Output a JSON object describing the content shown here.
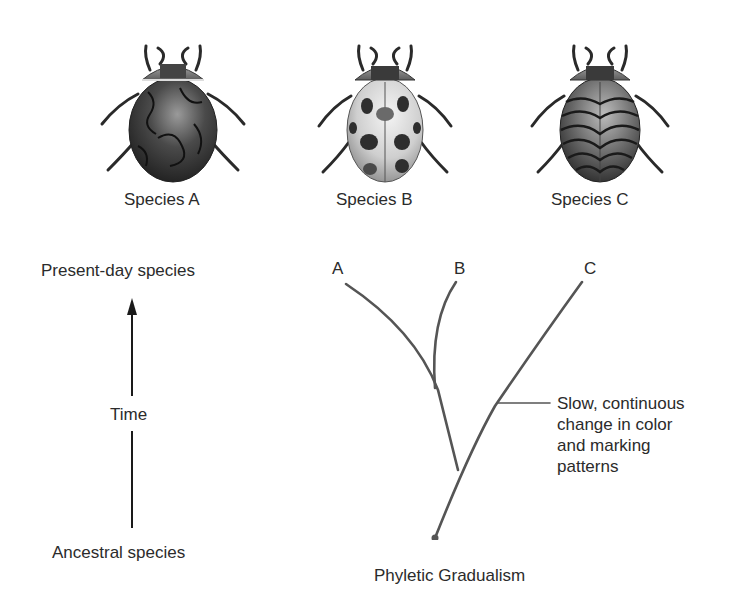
{
  "species": [
    {
      "id": "A",
      "label": "Species A",
      "pattern": "marbled-dark-lines",
      "shell_color": "#3a3a3a"
    },
    {
      "id": "B",
      "label": "Species B",
      "pattern": "spotted",
      "shell_color": "#d6d6d6"
    },
    {
      "id": "C",
      "label": "Species C",
      "pattern": "wavy-stripes",
      "shell_color": "#5a5a5a"
    }
  ],
  "timeline": {
    "top_label": "Present-day species",
    "middle_label": "Time",
    "bottom_label": "Ancestral species"
  },
  "tree": {
    "branch_labels": [
      "A",
      "B",
      "C"
    ],
    "annotation_lines": [
      "Slow, continuous",
      "change in color",
      "and marking",
      "patterns"
    ],
    "caption": "Phyletic Gradualism",
    "line_color": "#555555"
  }
}
